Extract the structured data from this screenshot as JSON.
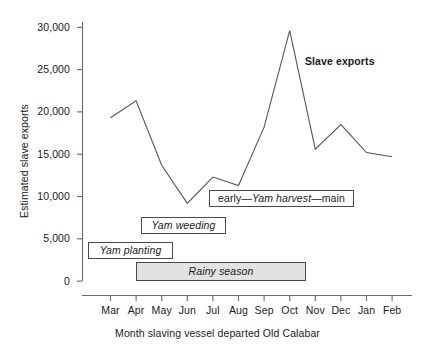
{
  "chart_data": {
    "type": "line",
    "title": "",
    "xlabel": "Month slaving vessel departed Old Calabar",
    "ylabel": "Estimated slave exports",
    "categories": [
      "Mar",
      "Apr",
      "May",
      "Jun",
      "Jul",
      "Aug",
      "Sep",
      "Oct",
      "Nov",
      "Dec",
      "Jan",
      "Feb"
    ],
    "series": [
      {
        "name": "Slave exports",
        "values": [
          19300,
          21300,
          13700,
          9200,
          12300,
          11300,
          18200,
          29600,
          15600,
          18500,
          15200,
          14700
        ]
      }
    ],
    "ylim": [
      0,
      30000
    ],
    "yticks": [
      0,
      5000,
      10000,
      15000,
      20000,
      25000,
      30000
    ],
    "ytick_labels": [
      "0",
      "5,000",
      "10,000",
      "15,000",
      "20,000",
      "25,000",
      "30,000"
    ],
    "grid": false,
    "legend": "none",
    "line_color": "#555555",
    "annotations": [
      {
        "id": "slave-exports",
        "text": "Slave exports",
        "style": "bold-text"
      },
      {
        "id": "yam-planting",
        "text": "Yam planting",
        "style": "box",
        "fill": "#ffffff",
        "span_months": [
          "Mar",
          "Apr"
        ]
      },
      {
        "id": "yam-weeding",
        "text": "Yam weeding",
        "style": "box",
        "fill": "#ffffff",
        "span_months": [
          "May",
          "Jun"
        ]
      },
      {
        "id": "yam-harvest",
        "text_prefix": "early—",
        "text_italic": "Yam harvest",
        "text_suffix": "—main",
        "text": "early—Yam harvest—main",
        "style": "box",
        "fill": "#ffffff",
        "span_months": [
          "Jul",
          "Nov"
        ]
      },
      {
        "id": "rainy-season",
        "text": "Rainy season",
        "style": "box-filled",
        "fill": "#e2e2e2",
        "span_months": [
          "Apr",
          "Oct"
        ]
      }
    ]
  },
  "axes": {
    "y_title": "Estimated slave exports",
    "x_title": "Month slaving vessel departed Old Calabar",
    "y_tick_labels": [
      "30,000",
      "25,000",
      "20,000",
      "15,000",
      "10,000",
      "5,000",
      "0"
    ],
    "x_tick_labels": [
      "Mar",
      "Apr",
      "May",
      "Jun",
      "Jul",
      "Aug",
      "Sep",
      "Oct",
      "Nov",
      "Dec",
      "Jan",
      "Feb"
    ]
  },
  "annotations": {
    "series_label": "Slave exports",
    "yam_planting": "Yam planting",
    "yam_weeding": "Yam weeding",
    "harvest_prefix": "early—",
    "harvest_italic": "Yam harvest",
    "harvest_suffix": "—main",
    "rainy_season": "Rainy season"
  }
}
